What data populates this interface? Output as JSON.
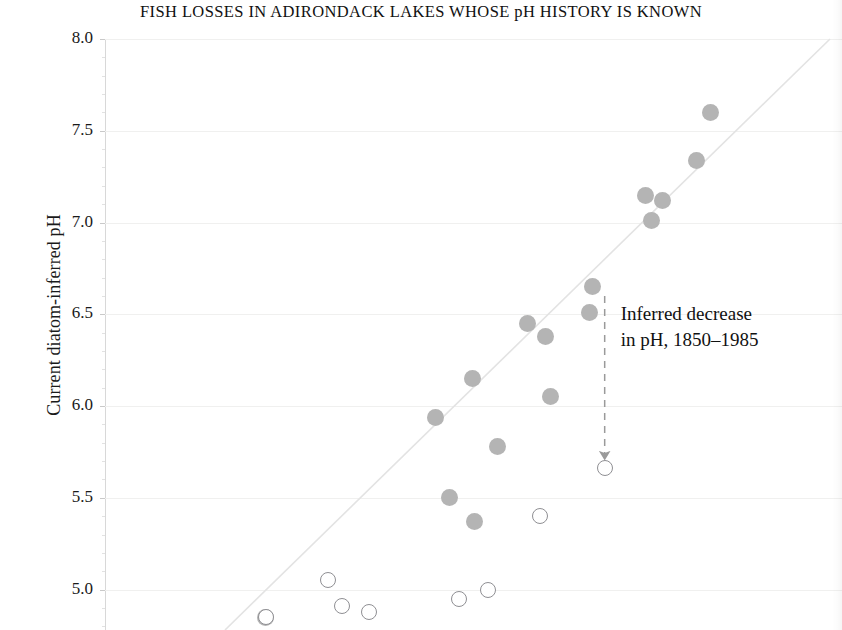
{
  "chart_data": {
    "type": "scatter",
    "title": "FISH LOSSES IN ADIRONDACK LAKES WHOSE pH HISTORY IS KNOWN",
    "xlabel": "",
    "ylabel": "Current diatom-inferred pH",
    "ylim": [
      4.78,
      8.0
    ],
    "xlim": [
      0,
      100
    ],
    "grid": true,
    "legend_position": "none",
    "yticks": [
      "8.0",
      "7.5",
      "7.0",
      "6.5",
      "6.0",
      "5.5",
      "5.0"
    ],
    "ytick_values": [
      8.0,
      7.5,
      7.0,
      6.5,
      6.0,
      5.5,
      5.0
    ],
    "reference_line": {
      "label": "1:1 line",
      "color": "#e3e3e3"
    },
    "series": [
      {
        "name": "Inferred pH in 1850 (filled)",
        "marker": "filled-circle",
        "color": "#b4b4b4",
        "points": [
          {
            "x": 82.2,
            "y": 7.6
          },
          {
            "x": 80.2,
            "y": 7.34
          },
          {
            "x": 73.4,
            "y": 7.15
          },
          {
            "x": 75.6,
            "y": 7.12
          },
          {
            "x": 74.2,
            "y": 7.01
          },
          {
            "x": 66.2,
            "y": 6.65
          },
          {
            "x": 65.8,
            "y": 6.51
          },
          {
            "x": 57.3,
            "y": 6.45
          },
          {
            "x": 59.8,
            "y": 6.38
          },
          {
            "x": 60.4,
            "y": 6.05
          },
          {
            "x": 49.8,
            "y": 6.15
          },
          {
            "x": 44.8,
            "y": 5.94
          },
          {
            "x": 53.3,
            "y": 5.78
          },
          {
            "x": 46.8,
            "y": 5.5
          },
          {
            "x": 50.1,
            "y": 5.37
          },
          {
            "x": 21.8,
            "y": 4.85
          }
        ]
      },
      {
        "name": "Current pH, 1985 (open)",
        "marker": "open-circle",
        "color": "#8f8f93",
        "points": [
          {
            "x": 67.8,
            "y": 5.66
          },
          {
            "x": 59.0,
            "y": 5.4
          },
          {
            "x": 30.2,
            "y": 5.05
          },
          {
            "x": 52.0,
            "y": 5.0
          },
          {
            "x": 48.0,
            "y": 4.95
          },
          {
            "x": 32.2,
            "y": 4.91
          },
          {
            "x": 35.8,
            "y": 4.88
          },
          {
            "x": 21.8,
            "y": 4.85
          }
        ]
      }
    ],
    "annotations": [
      {
        "name": "inferred-decrease",
        "text_lines": [
          "Inferred decrease",
          "in pH, 1850–1985"
        ],
        "arrow_from": {
          "x": 67.8,
          "y": 6.6
        },
        "arrow_to": {
          "x": 67.8,
          "y": 5.73
        },
        "style": "dashed-arrow"
      }
    ]
  },
  "axis": {
    "ylabel": "Current diatom-inferred pH"
  },
  "annotation": {
    "line1": "Inferred decrease",
    "line2": "in pH, 1850–1985"
  }
}
